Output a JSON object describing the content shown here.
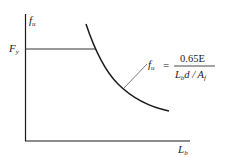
{
  "diagram": {
    "y_axis_label": "f",
    "y_axis_label_sub": "u",
    "x_axis_label": "L",
    "x_axis_label_sub": "b",
    "yield_label": "F",
    "yield_label_sub": "y",
    "formula": {
      "lhs": "f",
      "lhs_sub": "u",
      "equals": "=",
      "numerator": "0.65E",
      "denominator_L": "L",
      "denominator_L_sub": "b",
      "denominator_rest": "d / A",
      "denominator_A_sub": "f"
    },
    "colors": {
      "line": "#1a1a1a",
      "leader": "#555555"
    }
  }
}
